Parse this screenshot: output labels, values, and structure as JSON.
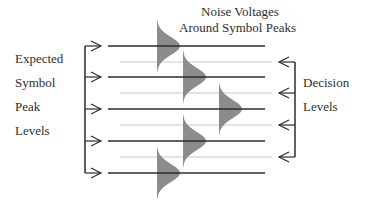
{
  "title_lines": [
    "Noise Voltages",
    "Around Symbol Peaks"
  ],
  "left_label_lines": [
    "Expected",
    "Symbol",
    "Peak",
    "Levels"
  ],
  "right_label_lines": [
    "Decision",
    "Levels"
  ],
  "colors": {
    "line": "#2b2b2b",
    "decision_line": "#c8c8c8",
    "noise_fill": "#8c8c8c",
    "text": "#2e2e2e"
  },
  "symbol_levels": [
    {
      "y": 46,
      "noise_x": 157
    },
    {
      "y": 77,
      "noise_x": 183
    },
    {
      "y": 109,
      "noise_x": 219
    },
    {
      "y": 141,
      "noise_x": 183
    },
    {
      "y": 173,
      "noise_x": 157
    }
  ],
  "decision_levels": [
    62,
    93,
    125,
    157
  ]
}
